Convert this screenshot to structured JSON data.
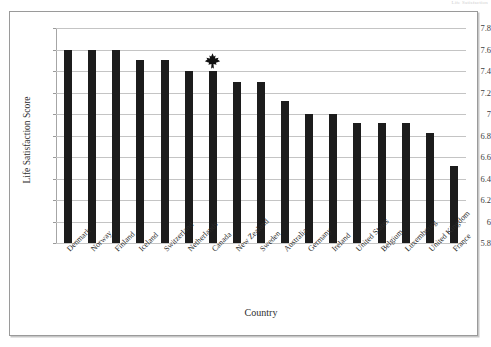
{
  "page": {
    "running_header": "Life Satisfaction"
  },
  "figure": {
    "frame": true
  },
  "chart_data": {
    "type": "bar",
    "title": "",
    "subtitle": "",
    "xlabel": "Country",
    "ylabel": "Life Satisfaction Score",
    "ylim": [
      5.8,
      7.8
    ],
    "ytick_labels": [
      "5.8",
      "6",
      "6.2",
      "6.4",
      "6.6",
      "6.8",
      "7",
      "7.2",
      "7.4",
      "7.6",
      "7.8"
    ],
    "ytick_values": [
      5.8,
      6.0,
      6.2,
      6.4,
      6.6,
      6.8,
      7.0,
      7.2,
      7.4,
      7.6,
      7.8
    ],
    "grid": true,
    "legend": "none",
    "bar_color": "#1c1c1c",
    "categories": [
      "Denmark",
      "Norway",
      "Finland",
      "Iceland",
      "Switzerland",
      "Netherlands",
      "Canada",
      "New Zealand",
      "Sweden",
      "Australia",
      "Germany",
      "Ireland",
      "United States",
      "Belgium",
      "Luxembourg",
      "United Kingdom",
      "France"
    ],
    "values": [
      7.6,
      7.6,
      7.6,
      7.5,
      7.5,
      7.4,
      7.4,
      7.3,
      7.3,
      7.12,
      7.0,
      7.0,
      6.92,
      6.92,
      6.92,
      6.82,
      6.52
    ],
    "annotations": [
      {
        "type": "icon",
        "icon": "maple-leaf-icon",
        "category": "Canada",
        "label": "Canada highlight"
      }
    ]
  }
}
